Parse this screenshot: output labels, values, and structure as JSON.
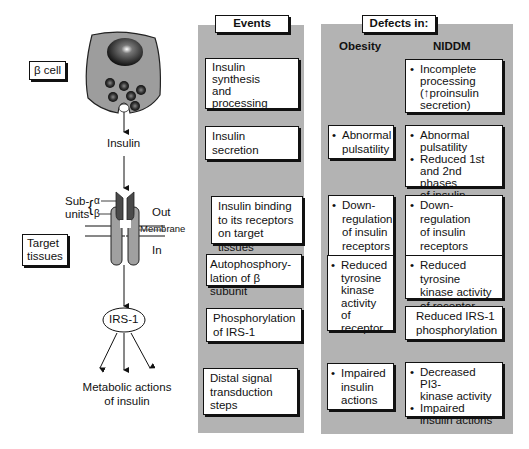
{
  "left": {
    "beta_cell_label": "β cell",
    "insulin_label": "Insulin",
    "subunits_label_1": "Sub-",
    "subunits_label_2": "units",
    "alpha_label": "α",
    "beta_label": "β",
    "out_label": "Out",
    "membrane_label": "Membrane",
    "in_label": "In",
    "target_tissues_1": "Target",
    "target_tissues_2": "tissues",
    "irs1_label": "IRS-1",
    "metabolic_1": "Metabolic actions",
    "metabolic_2": "of insulin"
  },
  "events": {
    "header": "Events",
    "steps": [
      {
        "lines": [
          "Insulin",
          "synthesis",
          "and",
          "processing"
        ]
      },
      {
        "lines": [
          "Insulin",
          "secretion"
        ]
      },
      {
        "lines": [
          "Insulin binding",
          "to its receptors",
          "on target tissues"
        ]
      },
      {
        "lines": [
          "Autophosphory-",
          "lation of β subunit"
        ]
      },
      {
        "lines": [
          "Phosphorylation",
          "of IRS-1"
        ]
      },
      {
        "lines": [
          "Distal signal",
          "transduction",
          "steps"
        ]
      }
    ]
  },
  "defects": {
    "header": "Defects in:",
    "col_obesity": "Obesity",
    "col_niddm": "NIDDM",
    "obesity": [
      {
        "bullets": [
          [
            "Abnormal",
            "pulsatility"
          ]
        ]
      },
      {
        "bullets": [
          [
            "Down-",
            "regulation",
            "of insulin",
            "receptors"
          ]
        ]
      },
      {
        "bullets": [
          [
            "Reduced",
            "tyrosine",
            "kinase",
            "activity",
            "of receptor"
          ]
        ]
      },
      {
        "bullets": [
          [
            "Impaired",
            "insulin",
            "actions"
          ]
        ]
      }
    ],
    "niddm": [
      {
        "bullets": [
          [
            "Incomplete",
            "processing",
            "(↑proinsulin",
            "secretion)"
          ]
        ]
      },
      {
        "bullets": [
          [
            "Abnormal",
            "pulsatility"
          ],
          [
            "Reduced 1st",
            "and 2nd phases",
            "of insulin release"
          ]
        ]
      },
      {
        "bullets": [
          [
            "Down-",
            "regulation",
            "of insulin",
            "receptors"
          ]
        ]
      },
      {
        "bullets": [
          [
            "Reduced tyrosine",
            "kinase activity",
            "of receptor"
          ]
        ]
      },
      {
        "plain": [
          "Reduced IRS-1",
          "phosphorylation"
        ]
      },
      {
        "bullets": [
          [
            "Decreased PI3-",
            "kinase activity"
          ],
          [
            "Impaired",
            "insulin actions"
          ]
        ]
      }
    ]
  }
}
